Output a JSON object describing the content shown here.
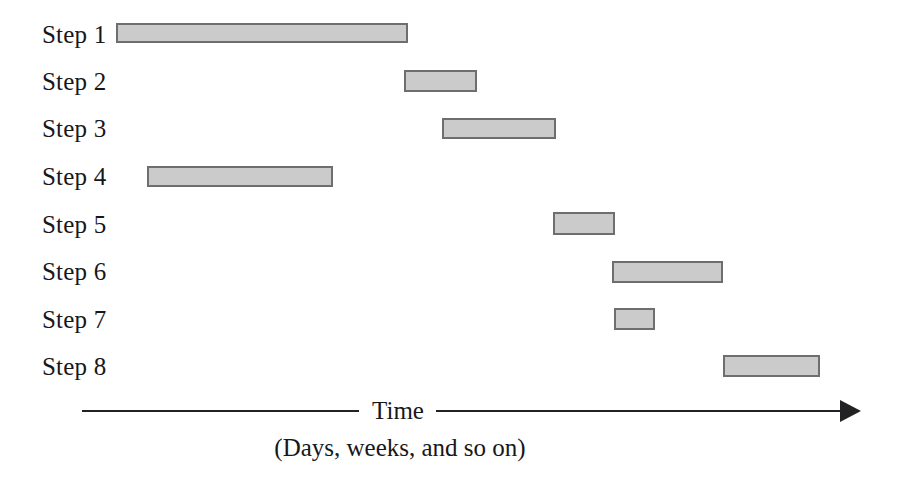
{
  "chart_data": {
    "type": "bar",
    "title": "",
    "subtitle": "",
    "xlabel": "Time",
    "xlabel_note": "(Days, weeks, and so on)",
    "ylabel": "",
    "orientation": "horizontal",
    "grid": false,
    "legend": null,
    "axis": {
      "show_arrow": true,
      "arrow_direction": "right",
      "tick_labels": [],
      "xlim_px": [
        82,
        860
      ]
    },
    "colors": {
      "bar_fill": "#cbcbcb",
      "bar_border": "#6e6e6e",
      "axis": "#222225",
      "text": "#17171a",
      "background": "#ffffff"
    },
    "categories": [
      "Step 1",
      "Step 2",
      "Step 3",
      "Step 4",
      "Step 5",
      "Step 6",
      "Step 7",
      "Step 8"
    ],
    "bars": [
      {
        "label": "Step 1",
        "start": 116,
        "end": 408,
        "length": 292,
        "top": 23,
        "height": 20
      },
      {
        "label": "Step 2",
        "start": 404,
        "end": 477,
        "length": 73,
        "top": 70,
        "height": 22
      },
      {
        "label": "Step 3",
        "start": 442,
        "end": 556,
        "length": 114,
        "top": 118,
        "height": 21
      },
      {
        "label": "Step 4",
        "start": 147,
        "end": 333,
        "length": 186,
        "top": 166,
        "height": 21
      },
      {
        "label": "Step 5",
        "start": 553,
        "end": 615,
        "length": 62,
        "top": 212,
        "height": 23
      },
      {
        "label": "Step 6",
        "start": 612,
        "end": 723,
        "length": 111,
        "top": 261,
        "height": 22
      },
      {
        "label": "Step 7",
        "start": 614,
        "end": 655,
        "length": 41,
        "top": 308,
        "height": 22
      },
      {
        "label": "Step 8",
        "start": 723,
        "end": 820,
        "length": 97,
        "top": 355,
        "height": 22
      }
    ],
    "rows": [
      {
        "label": "Step 1",
        "row_top": 11
      },
      {
        "label": "Step 2",
        "row_top": 58
      },
      {
        "label": "Step 3",
        "row_top": 105
      },
      {
        "label": "Step 4",
        "row_top": 153
      },
      {
        "label": "Step 5",
        "row_top": 201
      },
      {
        "label": "Step 6",
        "row_top": 248
      },
      {
        "label": "Step 7",
        "row_top": 296
      },
      {
        "label": "Step 8",
        "row_top": 343
      }
    ]
  },
  "axis": {
    "time_label": "Time",
    "sub_label": "(Days, weeks, and so on)"
  },
  "steps": [
    {
      "label": "Step 1"
    },
    {
      "label": "Step 2"
    },
    {
      "label": "Step 3"
    },
    {
      "label": "Step 4"
    },
    {
      "label": "Step 5"
    },
    {
      "label": "Step 6"
    },
    {
      "label": "Step 7"
    },
    {
      "label": "Step 8"
    }
  ]
}
